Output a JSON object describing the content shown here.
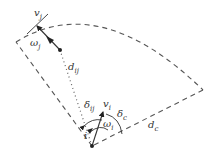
{
  "diagram": {
    "labels": {
      "v_j": {
        "main": "v",
        "sub": "j"
      },
      "omega_j": {
        "main": "ω",
        "sub": "j"
      },
      "d_ij": {
        "main": "d",
        "sub": "ij"
      },
      "delta_ij": {
        "main": "δ",
        "sub": "ij"
      },
      "v_i": {
        "main": "v",
        "sub": "i"
      },
      "omega_i": {
        "main": "ω",
        "sub": "i"
      },
      "delta_c": {
        "main": "δ",
        "sub": "c"
      },
      "d_c": {
        "main": "d",
        "sub": "c"
      },
      "i_mark": {
        "main": "i",
        "sub": ""
      }
    },
    "colors": {
      "stroke": "#555555",
      "arrow": "#222222",
      "background": "#ffffff"
    }
  }
}
